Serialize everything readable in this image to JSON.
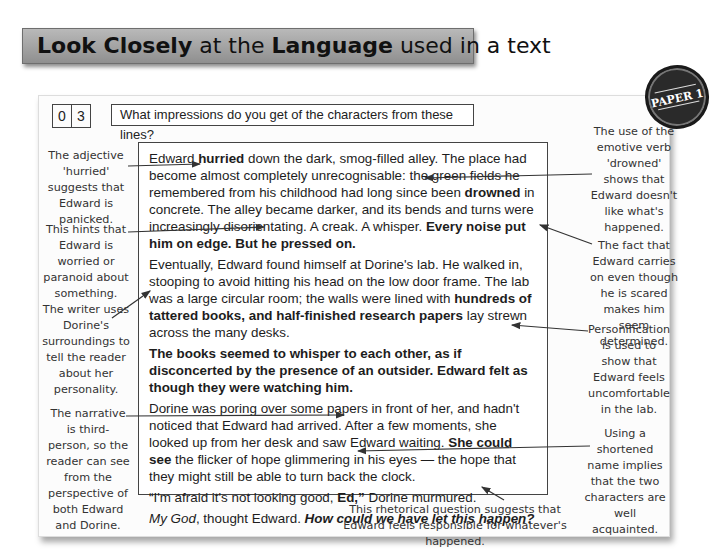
{
  "header": {
    "title_bold_1": "Look Closely",
    "title_text_1": " at the ",
    "title_bold_2": "Language",
    "title_text_2": " used in a text"
  },
  "badge": {
    "label": "PAPER 1"
  },
  "question": {
    "number_digits": [
      "0",
      "3"
    ],
    "text": "What impressions do you get of the characters from these lines?"
  },
  "extract": {
    "paragraphs": [
      {
        "segments": [
          {
            "t": "Edward ",
            "s": ""
          },
          {
            "t": "hurried",
            "s": "b"
          },
          {
            "t": " down the dark, smog-filled alley.  The place had become almost completely unrecognisable: the green fields he remembered from his childhood had long since been ",
            "s": ""
          },
          {
            "t": "drowned",
            "s": "b"
          },
          {
            "t": " in concrete.  The alley became darker, and its bends and turns were increasingly disorientating. A creak.  A whisper.  ",
            "s": ""
          },
          {
            "t": "Every noise put him on edge.  But he pressed on.",
            "s": "b"
          }
        ]
      },
      {
        "segments": [
          {
            "t": "Eventually, Edward found himself at Dorine's lab.  He walked in, stooping to avoid hitting his head on the low door frame.  The lab was a large circular room; the walls were lined with ",
            "s": ""
          },
          {
            "t": "hundreds of tattered books, and half-finished research papers",
            "s": "b"
          },
          {
            "t": " lay strewn across the many desks.",
            "s": ""
          }
        ]
      },
      {
        "segments": [
          {
            "t": "The books seemed to whisper to each other, as if disconcerted by the presence of an outsider.  Edward felt as though they were watching him.",
            "s": "b"
          }
        ]
      },
      {
        "segments": [
          {
            "t": "Dorine was poring over some papers in front of her, and hadn't noticed that Edward had arrived.  After a few moments, she looked up from her desk and saw Edward waiting.  ",
            "s": ""
          },
          {
            "t": "She could see",
            "s": "b"
          },
          {
            "t": " the flicker of hope glimmering in his eyes — the hope that they might still be able to turn back the clock.",
            "s": ""
          }
        ]
      },
      {
        "segments": [
          {
            "t": "“I'm afraid it's not looking good, ",
            "s": ""
          },
          {
            "t": "Ed,”",
            "s": "b"
          },
          {
            "t": " Dorine murmured.",
            "s": ""
          }
        ]
      },
      {
        "segments": [
          {
            "t": "My God",
            "s": "i"
          },
          {
            "t": ", thought Edward.  ",
            "s": ""
          },
          {
            "t": "How could we have let this happen?",
            "s": "bi"
          }
        ]
      }
    ]
  },
  "annotations": {
    "left": [
      "The adjective 'hurried' suggests that Edward is panicked.",
      "This hints that Edward is worried or paranoid about something.",
      "The writer uses Dorine's surroundings to tell the reader about her personality.",
      "The narrative is third-person, so the reader can see from the perspective of both Edward and Dorine."
    ],
    "right": [
      "The use of the emotive verb 'drowned' shows that Edward doesn't like what's happened.",
      "The fact that Edward carries on even though he is scared makes him seem determined.",
      "Personification is used to show that Edward feels uncomfortable in the lab.",
      "Using a shortened name implies that the two characters are well acquainted."
    ],
    "bottom": "This rhetorical question suggests that Edward feels responsible for whatever's happened."
  }
}
